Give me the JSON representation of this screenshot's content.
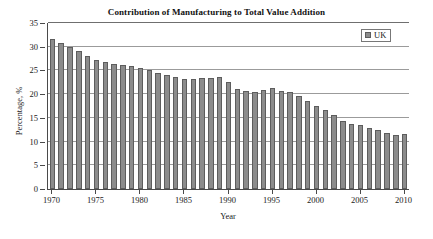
{
  "chart_data": {
    "type": "bar",
    "title": "Contribution of Manufacturing to Total Value Addition",
    "xlabel": "Year",
    "ylabel": "Percentage, %",
    "ylim": [
      0,
      35
    ],
    "ytick_step": 5,
    "yticks": [
      "35",
      "30",
      "25",
      "20",
      "15",
      "10",
      "5",
      "0"
    ],
    "xticks": [
      "1970",
      "1975",
      "1980",
      "1985",
      "1990",
      "1995",
      "2000",
      "2005",
      "2010"
    ],
    "xlim": [
      1970,
      2010
    ],
    "grid": "horizontal",
    "legend_position": "top-right",
    "bar_color": "#8c8c8c",
    "bar_edge_color": "#5d5d5d",
    "series": [
      {
        "name": "UK",
        "categories": [
          1970,
          1971,
          1972,
          1973,
          1974,
          1975,
          1976,
          1977,
          1978,
          1979,
          1980,
          1981,
          1982,
          1983,
          1984,
          1985,
          1986,
          1987,
          1988,
          1989,
          1990,
          1991,
          1992,
          1993,
          1994,
          1995,
          1996,
          1997,
          1998,
          1999,
          2000,
          2001,
          2002,
          2003,
          2004,
          2005,
          2006,
          2007,
          2008,
          2009,
          2010
        ],
        "values": [
          31.7,
          30.7,
          30.0,
          29.0,
          28.1,
          27.1,
          26.8,
          26.4,
          26.2,
          25.9,
          25.6,
          25.1,
          24.5,
          24.1,
          23.6,
          23.1,
          23.2,
          23.4,
          23.5,
          23.6,
          22.6,
          21.1,
          20.6,
          20.4,
          20.8,
          21.2,
          20.7,
          20.4,
          19.7,
          18.5,
          17.5,
          16.6,
          15.6,
          14.4,
          13.8,
          13.5,
          12.9,
          12.5,
          11.8,
          11.3,
          11.7
        ]
      }
    ]
  },
  "legend": {
    "entries": [
      {
        "label": "UK",
        "color": "#8c8c8c"
      }
    ]
  }
}
